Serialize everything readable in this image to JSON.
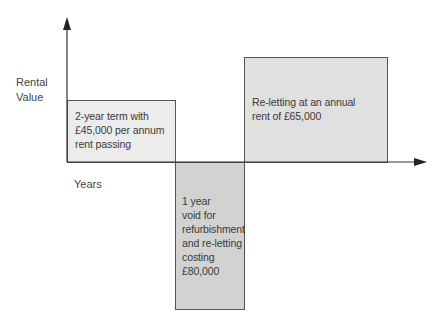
{
  "axes": {
    "y_label_line1": "Rental",
    "y_label_line2": "Value",
    "x_label": "Years"
  },
  "boxes": {
    "term": {
      "lines": [
        "2-year term with",
        "£45,000 per annum",
        "rent passing"
      ],
      "fill": "#ececec"
    },
    "void": {
      "lines": [
        "1 year",
        "void for",
        "refurbishment",
        "and re-letting",
        "costing",
        "£80,000"
      ],
      "fill": "#d2d2d2"
    },
    "reletting": {
      "lines": [
        "Re-letting at an annual",
        "rent of £65,000"
      ],
      "fill": "#e0e0e0"
    }
  },
  "colors": {
    "axis": "#333333",
    "border": "#555555"
  }
}
